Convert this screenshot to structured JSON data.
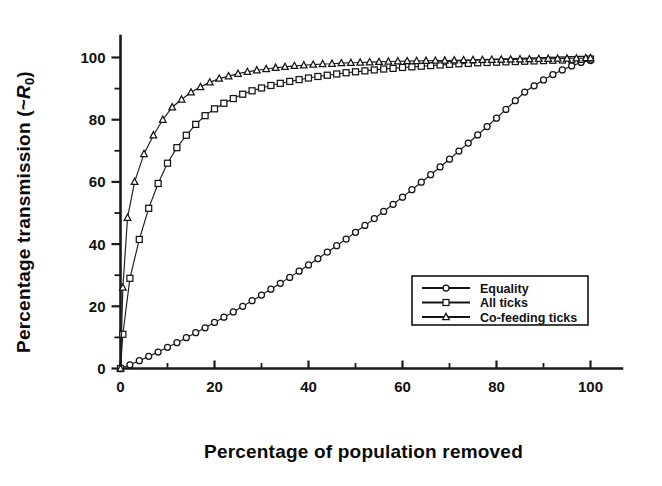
{
  "chart_data": {
    "type": "line",
    "title": "",
    "xlabel": "Percentage of population removed",
    "ylabel": "Percentage transmission (~R0)",
    "ylabel_main": "Percentage transmission (~",
    "ylabel_italic": "R",
    "ylabel_sub": "0",
    "ylabel_close": ")",
    "xlim": [
      0,
      100
    ],
    "ylim": [
      0,
      105
    ],
    "xticks": [
      0,
      20,
      40,
      60,
      80,
      100
    ],
    "yticks": [
      0,
      20,
      40,
      60,
      80,
      100
    ],
    "xticklabels": [
      "0",
      "20",
      "40",
      "60",
      "80",
      "100"
    ],
    "yticklabels": [
      "0",
      "20",
      "40",
      "60",
      "80",
      "100"
    ],
    "xminorticks": [
      10,
      30,
      50,
      70,
      90
    ],
    "yminorticks": [
      10,
      30,
      50,
      70,
      90
    ],
    "grid": false,
    "legend_position": "lower-right",
    "series": [
      {
        "name": "Equality",
        "marker": "circle",
        "x": [
          0,
          2,
          4,
          6,
          8,
          10,
          12,
          14,
          16,
          18,
          20,
          22,
          24,
          26,
          28,
          30,
          32,
          34,
          36,
          38,
          40,
          42,
          44,
          46,
          48,
          50,
          52,
          54,
          56,
          58,
          60,
          62,
          64,
          66,
          68,
          70,
          72,
          74,
          76,
          78,
          80,
          82,
          84,
          86,
          88,
          90,
          92,
          94,
          96,
          98,
          100
        ],
        "y": [
          0,
          1.2,
          2.5,
          3.9,
          5.3,
          6.8,
          8.3,
          9.9,
          11.5,
          13.1,
          14.8,
          16.5,
          18.2,
          20.0,
          21.8,
          23.6,
          25.5,
          27.4,
          29.3,
          31.3,
          33.3,
          35.3,
          37.4,
          39.5,
          41.6,
          43.8,
          46.0,
          48.2,
          50.5,
          52.8,
          55.1,
          57.5,
          59.9,
          62.3,
          64.8,
          67.3,
          69.9,
          72.5,
          75.1,
          77.8,
          80.5,
          83.3,
          86.1,
          88.9,
          90.9,
          92.8,
          94.5,
          96.0,
          97.3,
          98.4,
          99.0
        ]
      },
      {
        "name": "All ticks",
        "marker": "square",
        "x": [
          0,
          0.5,
          2,
          4,
          6,
          8,
          10,
          12,
          14,
          16,
          18,
          20,
          22,
          24,
          26,
          28,
          30,
          32,
          34,
          36,
          38,
          40,
          42,
          44,
          46,
          48,
          50,
          52,
          54,
          56,
          58,
          60,
          62,
          64,
          66,
          68,
          70,
          72,
          74,
          76,
          78,
          80,
          82,
          84,
          86,
          88,
          90,
          92,
          94,
          96,
          98,
          100
        ],
        "y": [
          0,
          11.0,
          29.0,
          41.5,
          51.5,
          59.5,
          66.0,
          71.0,
          75.0,
          78.5,
          81.3,
          83.5,
          85.3,
          86.8,
          88.2,
          89.3,
          90.2,
          91.0,
          91.7,
          92.3,
          92.9,
          93.4,
          93.9,
          94.3,
          94.7,
          95.1,
          95.4,
          95.7,
          96.0,
          96.3,
          96.5,
          96.8,
          97.0,
          97.2,
          97.4,
          97.6,
          97.8,
          98.0,
          98.1,
          98.3,
          98.4,
          98.5,
          98.6,
          98.7,
          98.8,
          98.9,
          99.0,
          99.1,
          99.2,
          99.3,
          99.4,
          99.5
        ]
      },
      {
        "name": "Co-feeding ticks",
        "marker": "triangle",
        "x": [
          0,
          0.5,
          1.5,
          3,
          5,
          7,
          9,
          11,
          13,
          15,
          17,
          19,
          21,
          23,
          25,
          27,
          29,
          31,
          33,
          35,
          37,
          39,
          41,
          43,
          45,
          47,
          49,
          51,
          53,
          55,
          57,
          59,
          61,
          63,
          65,
          67,
          69,
          71,
          73,
          75,
          77,
          79,
          81,
          83,
          85,
          87,
          89,
          91,
          93,
          95,
          97,
          99,
          100
        ],
        "y": [
          0,
          26.0,
          48.5,
          60.0,
          69.0,
          75.0,
          80.0,
          84.0,
          86.5,
          88.8,
          90.5,
          92.0,
          93.2,
          94.0,
          94.8,
          95.4,
          95.9,
          96.3,
          96.7,
          97.0,
          97.3,
          97.5,
          97.7,
          97.9,
          98.0,
          98.2,
          98.3,
          98.4,
          98.5,
          98.6,
          98.7,
          98.8,
          98.85,
          98.9,
          98.95,
          99.0,
          99.05,
          99.1,
          99.15,
          99.2,
          99.25,
          99.3,
          99.35,
          99.4,
          99.45,
          99.5,
          99.55,
          99.6,
          99.65,
          99.7,
          99.75,
          99.8,
          99.85
        ]
      }
    ],
    "legend": [
      {
        "label": "Equality",
        "marker": "circle"
      },
      {
        "label": "All ticks",
        "marker": "square"
      },
      {
        "label": "Co-feeding ticks",
        "marker": "triangle"
      }
    ]
  }
}
